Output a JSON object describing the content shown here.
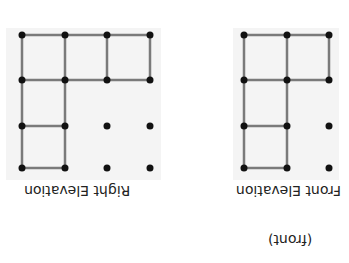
{
  "orientation": "rotated 180 degrees",
  "colors": {
    "line": "#7a7a7a",
    "dot": "#111111",
    "panel": "#f4f4f4"
  },
  "figures": [
    {
      "id": "right-elevation",
      "label": "Right Elevation",
      "grid_dots": {
        "cols": 4,
        "rows": 4
      }
    },
    {
      "id": "front-elevation",
      "label": "Front Elevation",
      "grid_dots": {
        "cols": 3,
        "rows": 4
      }
    }
  ],
  "caption": "(front)"
}
